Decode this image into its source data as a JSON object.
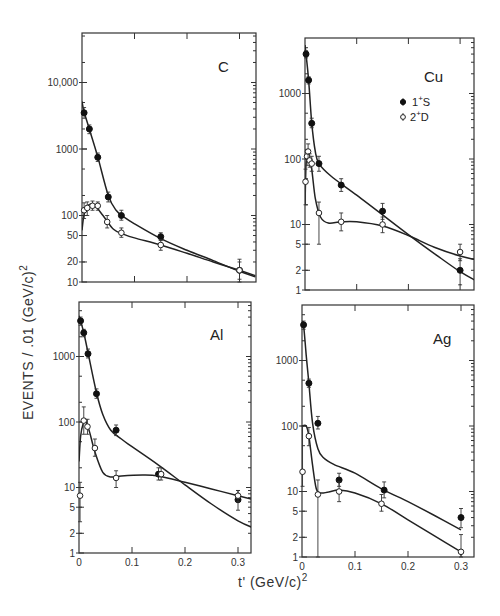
{
  "figure": {
    "ylabel": "EVENTS / .01 (GeV/c)",
    "ylabel_sup": "2",
    "xlabel": "t' (GeV/c)",
    "xlabel_sup": "2"
  },
  "legend": {
    "items": [
      {
        "label": "1+S",
        "base": "1",
        "sup": "+",
        "tail": "S",
        "marker": "filled"
      },
      {
        "label": "2+D",
        "base": "2",
        "sup": "+",
        "tail": "D",
        "marker": "open"
      }
    ]
  },
  "chart_data": [
    {
      "type": "scatter",
      "title": "C",
      "panel": "top-left",
      "xlabel": "t' (GeV/c)^2",
      "ylabel": "EVENTS / .01 (GeV/c)^2",
      "xlim": [
        0,
        0.33
      ],
      "ylim": [
        10,
        70000
      ],
      "yscale": "log",
      "xticks": [
        0,
        0.1,
        0.2,
        0.3
      ],
      "xtick_labels": [],
      "yticks": [
        10,
        20,
        50,
        100,
        1000,
        10000
      ],
      "ytick_labels": [
        "10",
        "20",
        "50",
        "100",
        "1000",
        "10,000"
      ],
      "frame": {
        "x0": 82,
        "x1": 256,
        "y_top": 33,
        "y_bot": 282,
        "px_x0": 82,
        "px_per_x": 525,
        "y_ref": 10,
        "px_y_ref": 282,
        "px_per_decade": 66.5
      },
      "series": [
        {
          "name": "1+S",
          "marker": "filled",
          "points": [
            [
              0.004,
              3500,
              2900,
              4200
            ],
            [
              0.014,
              2000,
              1700,
              2300
            ],
            [
              0.03,
              750,
              650,
              870
            ],
            [
              0.05,
              190,
              160,
              225
            ],
            [
              0.075,
              100,
              85,
              120
            ],
            [
              0.15,
              48,
              42,
              55
            ],
            [
              0.3,
              15,
              11,
              20
            ]
          ],
          "curve": [
            [
              0,
              5200
            ],
            [
              0.004,
              3600
            ],
            [
              0.014,
              2000
            ],
            [
              0.03,
              760
            ],
            [
              0.05,
              200
            ],
            [
              0.065,
              120
            ],
            [
              0.08,
              95
            ],
            [
              0.1,
              75
            ],
            [
              0.15,
              45
            ],
            [
              0.2,
              30
            ],
            [
              0.25,
              21
            ],
            [
              0.3,
              14.5
            ],
            [
              0.33,
              12
            ]
          ]
        },
        {
          "name": "2+D",
          "marker": "open",
          "points": [
            [
              0.004,
              120,
              90,
              155
            ],
            [
              0.01,
              130,
              100,
              160
            ],
            [
              0.02,
              140,
              120,
              165
            ],
            [
              0.03,
              140,
              120,
              160
            ],
            [
              0.048,
              80,
              65,
              100
            ],
            [
              0.075,
              55,
              47,
              65
            ],
            [
              0.15,
              36,
              30,
              43
            ],
            [
              0.3,
              15,
              10,
              22
            ]
          ],
          "curve": [
            [
              0,
              60
            ],
            [
              0.003,
              95
            ],
            [
              0.008,
              130
            ],
            [
              0.015,
              148
            ],
            [
              0.025,
              140
            ],
            [
              0.04,
              100
            ],
            [
              0.06,
              62
            ],
            [
              0.08,
              52
            ],
            [
              0.1,
              46
            ],
            [
              0.15,
              36
            ],
            [
              0.2,
              27
            ],
            [
              0.25,
              20
            ],
            [
              0.3,
              15
            ],
            [
              0.33,
              12.5
            ]
          ]
        }
      ]
    },
    {
      "type": "scatter",
      "title": "Cu",
      "panel": "top-right",
      "xlabel": "t' (GeV/c)^2",
      "ylabel": "EVENTS / .01 (GeV/c)^2",
      "xlim": [
        0,
        0.33
      ],
      "ylim": [
        1,
        6000
      ],
      "yscale": "log",
      "xticks": [
        0,
        0.1,
        0.2,
        0.3
      ],
      "xtick_labels": [],
      "yticks": [
        1,
        2,
        5,
        10,
        100,
        1000
      ],
      "ytick_labels": [
        "1",
        "2",
        "5",
        "10",
        "100",
        "1000"
      ],
      "frame": {
        "x0": 305,
        "x1": 474,
        "y_top": 38,
        "y_bot": 290,
        "px_x0": 305,
        "px_per_x": 517,
        "y_ref": 1,
        "px_y_ref": 290,
        "px_per_decade": 65.5
      },
      "series": [
        {
          "name": "1+S",
          "marker": "filled",
          "points": [
            [
              0.002,
              4000,
              3500,
              4500
            ],
            [
              0.007,
              1600,
              1400,
              1800
            ],
            [
              0.013,
              350,
              300,
              420
            ],
            [
              0.027,
              85,
              65,
              110
            ],
            [
              0.07,
              40,
              32,
              50
            ],
            [
              0.15,
              16,
              12,
              21
            ],
            [
              0.3,
              2,
              1.2,
              3
            ]
          ],
          "curve": [
            [
              0,
              5500
            ],
            [
              0.002,
              4000
            ],
            [
              0.007,
              1600
            ],
            [
              0.013,
              360
            ],
            [
              0.02,
              130
            ],
            [
              0.027,
              85
            ],
            [
              0.05,
              55
            ],
            [
              0.1,
              28
            ],
            [
              0.15,
              14
            ],
            [
              0.2,
              7
            ],
            [
              0.25,
              3.6
            ],
            [
              0.3,
              1.9
            ],
            [
              0.33,
              1.4
            ]
          ]
        },
        {
          "name": "2+D",
          "marker": "open",
          "points": [
            [
              0.001,
              45,
              20,
              70
            ],
            [
              0.004,
              110,
              80,
              140
            ],
            [
              0.006,
              130,
              95,
              170
            ],
            [
              0.009,
              95,
              75,
              120
            ],
            [
              0.013,
              85,
              65,
              110
            ],
            [
              0.027,
              15,
              5,
              22
            ],
            [
              0.07,
              11,
              8,
              15
            ],
            [
              0.15,
              10,
              7.5,
              13
            ],
            [
              0.3,
              3.8,
              2.8,
              5
            ]
          ],
          "curve": [
            [
              0,
              20
            ],
            [
              0.002,
              80
            ],
            [
              0.005,
              120
            ],
            [
              0.008,
              110
            ],
            [
              0.013,
              70
            ],
            [
              0.02,
              25
            ],
            [
              0.03,
              13
            ],
            [
              0.045,
              10.5
            ],
            [
              0.07,
              11
            ],
            [
              0.1,
              11
            ],
            [
              0.15,
              9.5
            ],
            [
              0.2,
              6.8
            ],
            [
              0.25,
              4.5
            ],
            [
              0.3,
              3.3
            ],
            [
              0.33,
              2.9
            ]
          ]
        }
      ]
    },
    {
      "type": "scatter",
      "title": "Al",
      "panel": "bottom-left",
      "xlabel": "t' (GeV/c)^2",
      "ylabel": "EVENTS / .01 (GeV/c)^2",
      "xlim": [
        0,
        0.33
      ],
      "ylim": [
        1,
        6000
      ],
      "yscale": "log",
      "xticks": [
        0,
        0.1,
        0.2,
        0.3
      ],
      "xtick_labels": [
        "0",
        "0.1",
        "0.2",
        "0.3"
      ],
      "yticks": [
        1,
        2,
        5,
        10,
        100,
        1000
      ],
      "ytick_labels": [
        "1",
        "2",
        "5",
        "10",
        "100",
        "1000"
      ],
      "frame": {
        "x0": 79,
        "x1": 251,
        "y_top": 302,
        "y_bot": 553,
        "px_x0": 79,
        "px_per_x": 530,
        "y_ref": 1,
        "px_y_ref": 553,
        "px_per_decade": 65.5
      },
      "series": [
        {
          "name": "1+S",
          "marker": "filled",
          "points": [
            [
              0.003,
              3500,
              3000,
              4000
            ],
            [
              0.009,
              2300,
              2000,
              2600
            ],
            [
              0.017,
              1100,
              950,
              1300
            ],
            [
              0.033,
              270,
              230,
              320
            ],
            [
              0.07,
              75,
              62,
              90
            ],
            [
              0.15,
              16,
              13,
              20
            ],
            [
              0.3,
              6.5,
              4.5,
              9
            ]
          ],
          "curve": [
            [
              0,
              4200
            ],
            [
              0.003,
              3500
            ],
            [
              0.009,
              2300
            ],
            [
              0.017,
              1150
            ],
            [
              0.033,
              280
            ],
            [
              0.045,
              130
            ],
            [
              0.06,
              75
            ],
            [
              0.08,
              55
            ],
            [
              0.1,
              42
            ],
            [
              0.15,
              22
            ],
            [
              0.2,
              11
            ],
            [
              0.25,
              5.6
            ],
            [
              0.3,
              3.1
            ],
            [
              0.33,
              2.4
            ]
          ]
        },
        {
          "name": "2+D",
          "marker": "open",
          "points": [
            [
              0.002,
              7.5,
              3,
              12
            ],
            [
              0.009,
              105,
              65,
              170
            ],
            [
              0.016,
              85,
              65,
              110
            ],
            [
              0.03,
              40,
              30,
              55
            ],
            [
              0.07,
              14,
              10,
              18
            ],
            [
              0.155,
              16,
              13,
              20
            ],
            [
              0.3,
              7.5,
              6,
              9
            ]
          ],
          "curve": [
            [
              0,
              25
            ],
            [
              0.003,
              60
            ],
            [
              0.008,
              95
            ],
            [
              0.013,
              100
            ],
            [
              0.02,
              70
            ],
            [
              0.03,
              35
            ],
            [
              0.045,
              17
            ],
            [
              0.06,
              14.5
            ],
            [
              0.08,
              15
            ],
            [
              0.12,
              15.5
            ],
            [
              0.15,
              15
            ],
            [
              0.2,
              12
            ],
            [
              0.25,
              9.5
            ],
            [
              0.3,
              7.5
            ],
            [
              0.33,
              6.5
            ]
          ]
        }
      ]
    },
    {
      "type": "scatter",
      "title": "Ag",
      "panel": "bottom-right",
      "xlabel": "t' (GeV/c)^2",
      "ylabel": "EVENTS / .01 (GeV/c)^2",
      "xlim": [
        0,
        0.33
      ],
      "ylim": [
        1,
        6000
      ],
      "yscale": "log",
      "xticks": [
        0,
        0.1,
        0.2,
        0.3
      ],
      "xtick_labels": [
        "0",
        "0.1",
        "0.2",
        "0.3"
      ],
      "yticks": [
        1,
        2,
        5,
        10,
        100,
        1000
      ],
      "ytick_labels": [
        "1",
        "2",
        "5",
        "10",
        "100",
        "1000"
      ],
      "frame": {
        "x0": 302,
        "x1": 474,
        "y_top": 305,
        "y_bot": 557,
        "px_x0": 302,
        "px_per_x": 530,
        "y_ref": 1,
        "px_y_ref": 557,
        "px_per_decade": 65.5
      },
      "series": [
        {
          "name": "1+S",
          "marker": "filled",
          "points": [
            [
              0.003,
              3500,
              3000,
              4000
            ],
            [
              0.013,
              450,
              390,
              520
            ],
            [
              0.03,
              110,
              90,
              140
            ],
            [
              0.07,
              15,
              12,
              19
            ],
            [
              0.155,
              10.5,
              8,
              14
            ],
            [
              0.3,
              4,
              2.8,
              5.5
            ]
          ],
          "curve": [
            [
              0,
              4000
            ],
            [
              0.003,
              3400
            ],
            [
              0.008,
              1200
            ],
            [
              0.013,
              450
            ],
            [
              0.02,
              110
            ],
            [
              0.03,
              45
            ],
            [
              0.04,
              33
            ],
            [
              0.06,
              26
            ],
            [
              0.1,
              19
            ],
            [
              0.15,
              11
            ],
            [
              0.2,
              7
            ],
            [
              0.25,
              4.3
            ],
            [
              0.3,
              2.6
            ]
          ]
        },
        {
          "name": "2+D",
          "marker": "open",
          "points": [
            [
              0.001,
              20,
              12,
              100
            ],
            [
              0.013,
              70,
              50,
              95
            ],
            [
              0.03,
              9,
              1,
              15
            ],
            [
              0.07,
              10,
              7,
              14
            ],
            [
              0.15,
              6.5,
              5,
              9
            ],
            [
              0.3,
              1.2,
              0.9,
              2.2
            ]
          ],
          "curve": [
            [
              0,
              100
            ],
            [
              0.008,
              100
            ],
            [
              0.013,
              70
            ],
            [
              0.02,
              25
            ],
            [
              0.027,
              11
            ],
            [
              0.035,
              9.5
            ],
            [
              0.05,
              9.8
            ],
            [
              0.07,
              10.5
            ],
            [
              0.1,
              9.5
            ],
            [
              0.15,
              6.5
            ],
            [
              0.2,
              3.7
            ],
            [
              0.25,
              2.1
            ],
            [
              0.3,
              1.2
            ]
          ]
        }
      ]
    }
  ]
}
